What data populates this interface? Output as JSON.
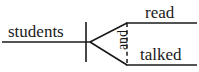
{
  "diagram": {
    "type": "reed-kellogg-sentence-diagram",
    "sentence": "students read and talked",
    "colors": {
      "background": "#ffffff",
      "line": "#1a1a1a",
      "text": "#1a1a1a"
    },
    "subject": {
      "text": "students",
      "role": "subject"
    },
    "predicates": [
      {
        "text": "read",
        "role": "compound-verb-upper"
      },
      {
        "text": "talked",
        "role": "compound-verb-lower"
      }
    ],
    "conjunction": {
      "text": "and",
      "role": "coordinating-conjunction",
      "orientation": "vertical",
      "line_style": "dashed"
    },
    "lines": {
      "baseline": {
        "x1": 2,
        "y1": 42,
        "x2": 90,
        "y2": 42
      },
      "subject_predicate_divider": {
        "x1": 86,
        "y1": 22,
        "x2": 86,
        "y2": 62
      },
      "fork_upper": {
        "x1": 90,
        "y1": 42,
        "x2": 127,
        "y2": 23
      },
      "fork_lower": {
        "x1": 90,
        "y1": 42,
        "x2": 127,
        "y2": 65
      },
      "conjunction_dashed": {
        "x1": 127,
        "y1": 23,
        "x2": 127,
        "y2": 65
      },
      "predicate_upper_baseline": {
        "x1": 127,
        "y1": 23,
        "x2": 197,
        "y2": 23
      },
      "predicate_lower_baseline": {
        "x1": 127,
        "y1": 65,
        "x2": 197,
        "y2": 65
      }
    }
  }
}
